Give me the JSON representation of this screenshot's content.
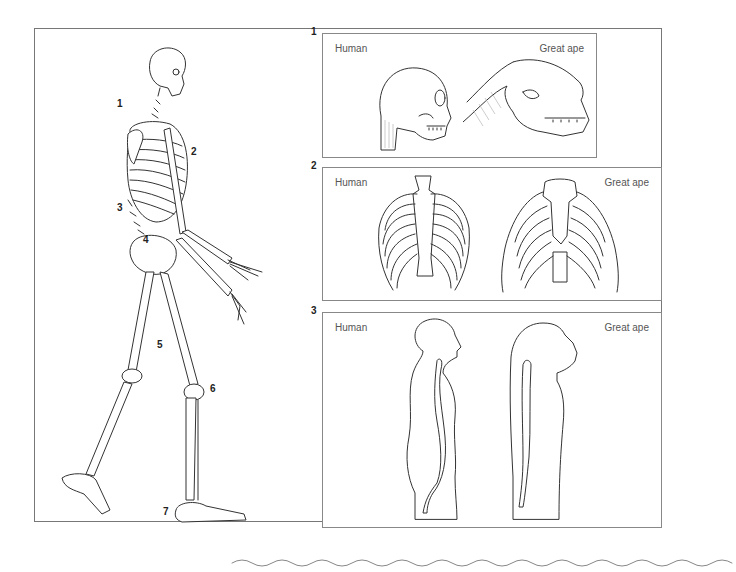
{
  "figure": {
    "skeleton_labels": [
      {
        "num": "1",
        "x": 117,
        "y": 104
      },
      {
        "num": "2",
        "x": 191,
        "y": 152
      },
      {
        "num": "3",
        "x": 117,
        "y": 208
      },
      {
        "num": "4",
        "x": 143,
        "y": 240
      },
      {
        "num": "5",
        "x": 157,
        "y": 345
      },
      {
        "num": "6",
        "x": 210,
        "y": 389
      },
      {
        "num": "7",
        "x": 163,
        "y": 512
      }
    ],
    "panels": [
      {
        "number": "1",
        "left_label": "Human",
        "right_label": "Great ape",
        "subject": "skull and neck"
      },
      {
        "number": "2",
        "left_label": "Human",
        "right_label": "Great ape",
        "subject": "rib cage"
      },
      {
        "number": "3",
        "left_label": "Human",
        "right_label": "Great ape",
        "subject": "spinal curvature silhouette"
      }
    ]
  }
}
